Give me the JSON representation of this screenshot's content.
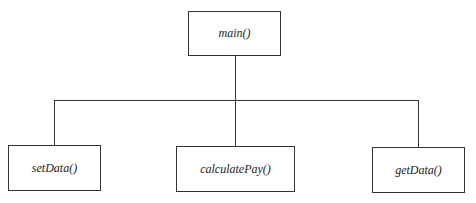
{
  "diagram": {
    "type": "structure-chart",
    "root": {
      "label": "main()"
    },
    "children": [
      {
        "label": "setData()"
      },
      {
        "label": "calculatePay()"
      },
      {
        "label": "getData()"
      }
    ]
  }
}
